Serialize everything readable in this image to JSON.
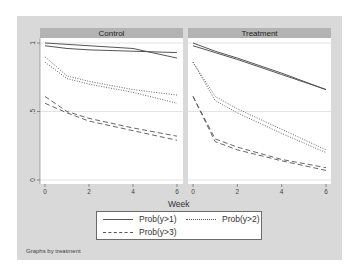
{
  "chart_data": {
    "type": "line",
    "xlabel": "Week",
    "ylabel": "",
    "xlim": [
      0,
      6
    ],
    "ylim": [
      0,
      1
    ],
    "x_ticks": [
      "0",
      "2",
      "4",
      "6"
    ],
    "y_ticks": [
      "0",
      ".5",
      "1"
    ],
    "grid": "horizontal at 0.5 and 1",
    "legend_position": "bottom",
    "legend": [
      "Prob(y>1)",
      "Prob(y>2)",
      "Prob(y>3)"
    ],
    "note": "Graphs by treatment",
    "x": [
      0,
      1,
      2,
      4,
      6
    ],
    "panels": [
      {
        "title": "Control",
        "series": [
          {
            "name": "Prob(y>1)",
            "style": "solid",
            "values": [
              1.0,
              0.99,
              0.98,
              0.96,
              0.89
            ]
          },
          {
            "name": "Prob(y>1)",
            "style": "solid",
            "values": [
              0.98,
              0.96,
              0.95,
              0.94,
              0.93
            ]
          },
          {
            "name": "Prob(y>2)",
            "style": "dotted",
            "values": [
              0.9,
              0.76,
              0.72,
              0.66,
              0.62
            ]
          },
          {
            "name": "Prob(y>2)",
            "style": "dotted",
            "values": [
              0.86,
              0.74,
              0.7,
              0.64,
              0.56
            ]
          },
          {
            "name": "Prob(y>3)",
            "style": "dashed",
            "values": [
              0.61,
              0.5,
              0.45,
              0.38,
              0.32
            ]
          },
          {
            "name": "Prob(y>3)",
            "style": "dashed",
            "values": [
              0.56,
              0.49,
              0.43,
              0.36,
              0.29
            ]
          }
        ]
      },
      {
        "title": "Treatment",
        "series": [
          {
            "name": "Prob(y>1)",
            "style": "solid",
            "values": [
              1.0,
              0.94,
              0.89,
              0.78,
              0.66
            ]
          },
          {
            "name": "Prob(y>1)",
            "style": "solid",
            "values": [
              0.98,
              0.93,
              0.88,
              0.77,
              0.66
            ]
          },
          {
            "name": "Prob(y>2)",
            "style": "dotted",
            "values": [
              0.86,
              0.61,
              0.52,
              0.37,
              0.22
            ]
          },
          {
            "name": "Prob(y>2)",
            "style": "dotted",
            "values": [
              0.86,
              0.58,
              0.49,
              0.34,
              0.2
            ]
          },
          {
            "name": "Prob(y>3)",
            "style": "dashed",
            "values": [
              0.61,
              0.3,
              0.24,
              0.15,
              0.09
            ]
          },
          {
            "name": "Prob(y>3)",
            "style": "dashed",
            "values": [
              0.61,
              0.28,
              0.22,
              0.14,
              0.07
            ]
          }
        ]
      }
    ]
  },
  "labels": {
    "panel_control": "Control",
    "panel_treatment": "Treatment",
    "xlabel": "Week",
    "legend_1": "Prob(y>1)",
    "legend_2": "Prob(y>2)",
    "legend_3": "Prob(y>3)",
    "note": "Graphs by treatment"
  },
  "colors": {
    "outer_bg": "#d9d9d9",
    "header_bg": "#b3b3b3",
    "plot_bg": "#ffffff",
    "line": "#555555"
  }
}
